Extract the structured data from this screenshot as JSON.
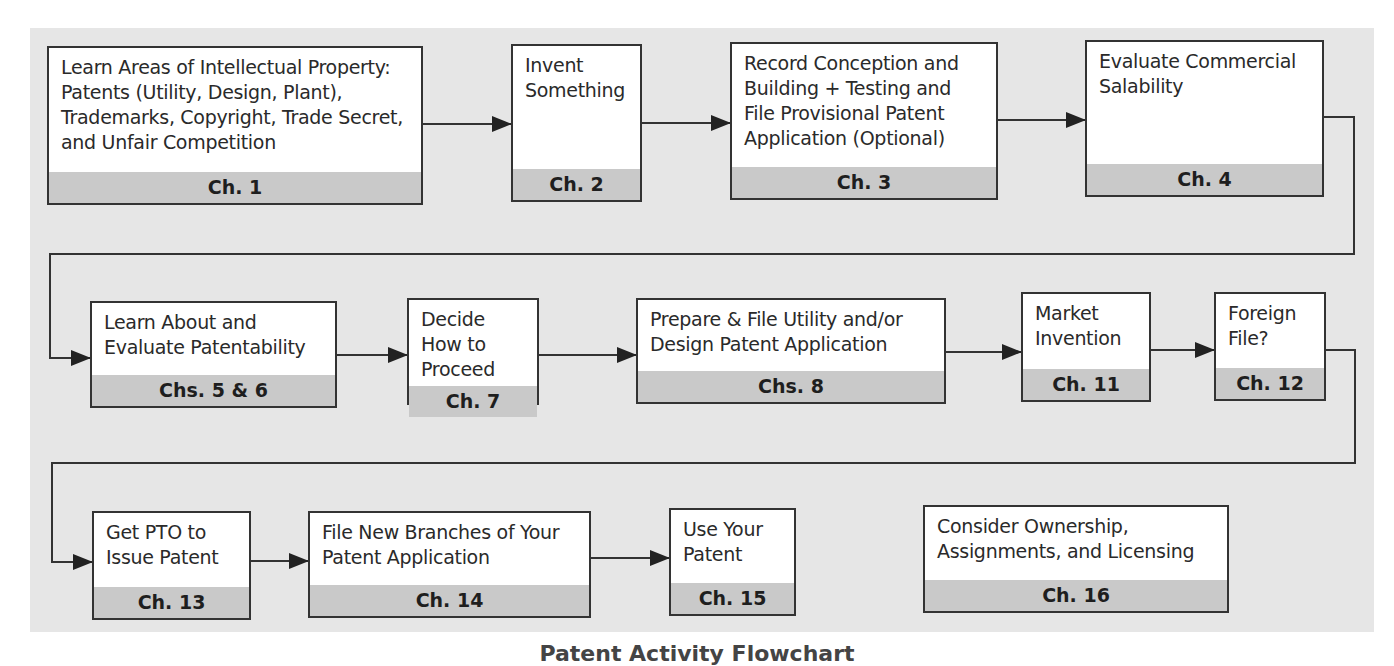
{
  "diagram": {
    "type": "flowchart",
    "caption": "Patent Activity Flowchart",
    "colors": {
      "panel": "#e6e6e6",
      "box": "#ffffff",
      "footer": "#c9c9c9",
      "line": "#333333"
    },
    "boxes": [
      {
        "id": "b1",
        "text": "Learn Areas of Intellectual Property: Patents (Utility, Design, Plant), Trademarks, Copyright, Trade Secret, and Unfair Competition",
        "chapter": "Ch. 1"
      },
      {
        "id": "b2",
        "text": "Invent Something",
        "chapter": "Ch. 2"
      },
      {
        "id": "b3",
        "text": "Record Conception and Building + Testing and File Provisional Patent Application (Optional)",
        "chapter": "Ch. 3"
      },
      {
        "id": "b4",
        "text": "Evaluate Commercial Salability",
        "chapter": "Ch. 4"
      },
      {
        "id": "b5",
        "text": "Learn About and Evaluate Patentability",
        "chapter": "Chs. 5 & 6"
      },
      {
        "id": "b7",
        "text": "Decide How to Proceed",
        "chapter": "Ch. 7"
      },
      {
        "id": "b8",
        "text": "Prepare & File Utility and/or Design Patent Application",
        "chapter": "Chs. 8"
      },
      {
        "id": "b11",
        "text": "Market Invention",
        "chapter": "Ch. 11"
      },
      {
        "id": "b12",
        "text": "Foreign File?",
        "chapter": "Ch. 12"
      },
      {
        "id": "b13",
        "text": "Get PTO to Issue Patent",
        "chapter": "Ch. 13"
      },
      {
        "id": "b14",
        "text": "File New Branches of Your Patent Application",
        "chapter": "Ch. 14"
      },
      {
        "id": "b15",
        "text": "Use Your Patent",
        "chapter": "Ch. 15"
      },
      {
        "id": "b16",
        "text": "Consider Ownership, Assignments, and Licensing",
        "chapter": "Ch. 16"
      }
    ],
    "edges": [
      [
        "b1",
        "b2"
      ],
      [
        "b2",
        "b3"
      ],
      [
        "b3",
        "b4"
      ],
      [
        "b4",
        "b5"
      ],
      [
        "b5",
        "b7"
      ],
      [
        "b7",
        "b8"
      ],
      [
        "b8",
        "b11"
      ],
      [
        "b11",
        "b12"
      ],
      [
        "b12",
        "b13"
      ],
      [
        "b13",
        "b14"
      ],
      [
        "b14",
        "b15"
      ]
    ]
  }
}
